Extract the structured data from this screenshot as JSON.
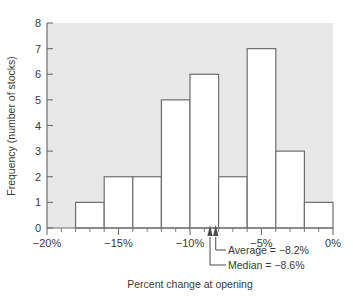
{
  "chart_data": {
    "type": "bar",
    "title": "",
    "subtitle": "",
    "xlabel": "Percent change at opening",
    "ylabel": "Frequency (number of stocks)",
    "xlim": [
      -20,
      0
    ],
    "ylim": [
      0,
      8
    ],
    "bin_width": 2,
    "grid": false,
    "legend_position": "none",
    "x_tick_labels": [
      "−20%",
      "−15%",
      "−10%",
      "−5%",
      "0%"
    ],
    "x_tick_values": [
      -20,
      -15,
      -10,
      -5,
      0
    ],
    "x_minor_tick_values": [
      -19,
      -18,
      -17,
      -16,
      -14,
      -13,
      -12,
      -11,
      -9,
      -8,
      -7,
      -6,
      -4,
      -3,
      -2,
      -1
    ],
    "y_tick_labels": [
      "0",
      "1",
      "2",
      "3",
      "4",
      "5",
      "6",
      "7",
      "8"
    ],
    "y_tick_values": [
      0,
      1,
      2,
      3,
      4,
      5,
      6,
      7,
      8
    ],
    "categories": [
      "−18% to −16%",
      "−16% to −14%",
      "−14% to −12%",
      "−12% to −10%",
      "−10% to −8%",
      "−8% to −6%",
      "−6% to −4%",
      "−4% to −2%",
      "−2% to 0%"
    ],
    "bin_edges": [
      -18,
      -16,
      -14,
      -12,
      -10,
      -8,
      -6,
      -4,
      -2,
      0
    ],
    "values": [
      1,
      2,
      2,
      5,
      6,
      2,
      7,
      3,
      1
    ],
    "total_count": 29,
    "annotations": [
      {
        "label": "Average",
        "equals": "=",
        "value": "−8.2%",
        "text": "Average  =  −8.2%",
        "x": -8.2
      },
      {
        "label": "Median",
        "equals": "=",
        "value": "−8.6%",
        "text": "Median  =  −8.6%",
        "x": -8.6
      }
    ]
  },
  "chart": {
    "plot_background_color": "#e8e8e8",
    "bar_fill_color": "#ffffff",
    "bar_stroke_color": "#6e6e6e",
    "axis_color": "#6e6e6e",
    "text_color": "#3a3a3a",
    "marker_color": "#4a4a4a"
  },
  "annotation_lines": {
    "average": "Average  =  −8.2%",
    "median": "Median  =  −8.6%"
  }
}
